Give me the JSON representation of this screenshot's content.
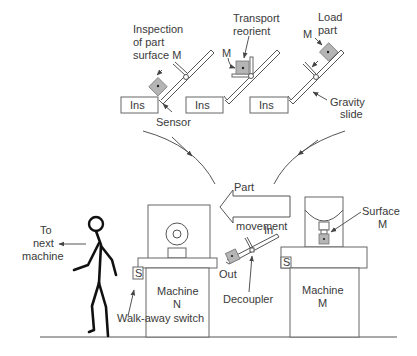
{
  "diagram": {
    "type": "walk-away / decoupler cell illustration",
    "stages": [
      {
        "id": "inspection",
        "label": [
          "Inspection",
          "of part",
          "surface M"
        ],
        "box_label": "Ins",
        "callout": "Sensor"
      },
      {
        "id": "transport",
        "label": [
          "Transport",
          "reorient"
        ],
        "box_label": "Ins",
        "part_label": "M"
      },
      {
        "id": "load",
        "label": [
          "Load",
          "part"
        ],
        "box_label": "Ins",
        "part_label": "M",
        "callout": [
          "Gravity",
          "slide"
        ]
      }
    ],
    "flow_arrow": {
      "label_top": "Part",
      "label_bottom": "movement",
      "direction": "left"
    },
    "machine_n": {
      "label": [
        "Machine",
        "N"
      ],
      "switch_label": "S",
      "switch_callout": "Walk-away switch"
    },
    "machine_m": {
      "label": [
        "Machine",
        "M"
      ],
      "switch_label": "S",
      "surface_callout": [
        "Surface",
        "M"
      ]
    },
    "decoupler": {
      "label": "Decoupler",
      "in_label": "In",
      "out_label": "Out"
    },
    "operator": {
      "callout": [
        "To",
        "next",
        "machine"
      ]
    },
    "colors": {
      "line": "#555555",
      "part_fill": "#b5b5b5",
      "text": "#3a3a3a",
      "figure": "#111111"
    }
  }
}
